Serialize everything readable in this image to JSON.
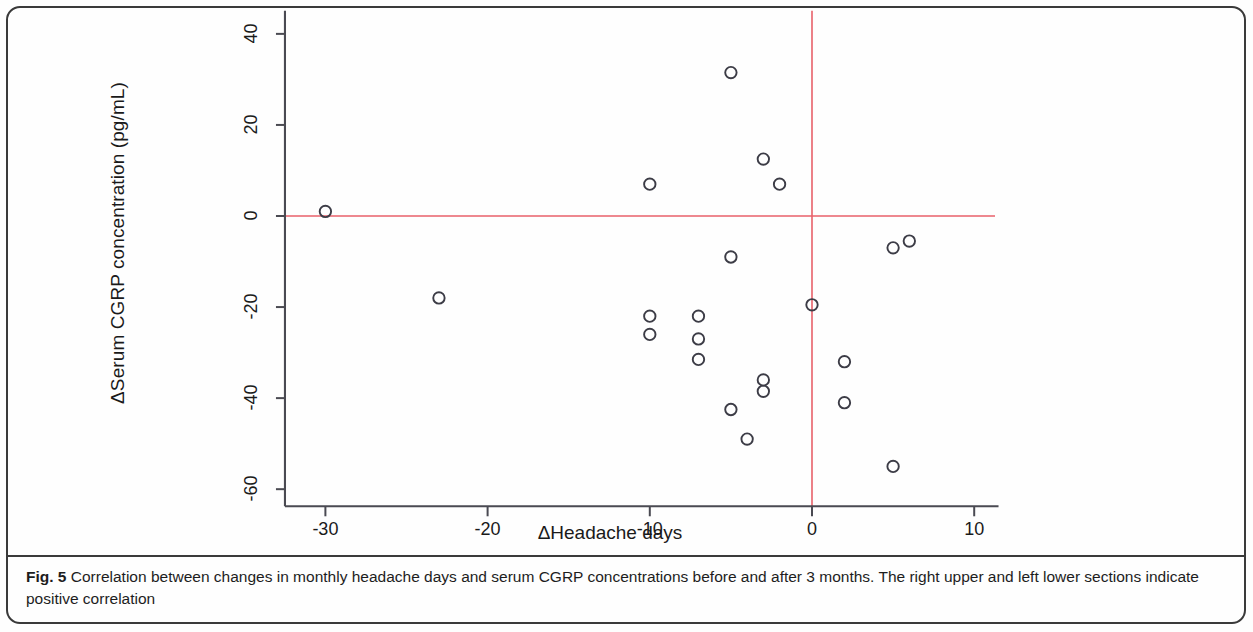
{
  "figure": {
    "label": "Fig. 5",
    "caption": "Correlation between changes in monthly headache days and serum CGRP concentrations before and after 3 months. The right upper and left lower sections indicate positive correlation"
  },
  "colors": {
    "reference_line": "#e8616a",
    "axis": "#4a4a52",
    "marker_stroke": "#3c3c46",
    "text": "#1a1a1a",
    "frame": "#3a3a3a"
  },
  "chart_data": {
    "type": "scatter",
    "title": "",
    "xlabel": "ΔHeadache days",
    "ylabel": "ΔSerum CGRP concentration (pg/mL)",
    "xlim": [
      -32,
      11.5
    ],
    "ylim": [
      -62,
      42
    ],
    "xticks": [
      -30,
      -20,
      -10,
      0,
      10
    ],
    "xtick_labels": [
      "-30",
      "-20",
      "-10",
      "0",
      "10"
    ],
    "yticks": [
      40,
      20,
      0,
      -20,
      -40,
      -60
    ],
    "ytick_labels": [
      "40",
      "20",
      "0",
      "-20",
      "-40",
      "-60"
    ],
    "grid": false,
    "legend": null,
    "reference_lines": [
      {
        "orientation": "horizontal",
        "value": 0,
        "color": "#e8616a"
      },
      {
        "orientation": "vertical",
        "value": 0,
        "color": "#e8616a"
      }
    ],
    "marker": {
      "shape": "open-circle",
      "size": 7,
      "stroke": "#3c3c46",
      "fill": "none"
    },
    "n_points": 22,
    "points": [
      {
        "x": -30,
        "y": 1
      },
      {
        "x": -23,
        "y": -18
      },
      {
        "x": -10,
        "y": 7
      },
      {
        "x": -10,
        "y": -22
      },
      {
        "x": -10,
        "y": -26
      },
      {
        "x": -7,
        "y": -22
      },
      {
        "x": -7,
        "y": -27
      },
      {
        "x": -7,
        "y": -31.5
      },
      {
        "x": -5,
        "y": 31.5
      },
      {
        "x": -5,
        "y": -9
      },
      {
        "x": -5,
        "y": -42.5
      },
      {
        "x": -4,
        "y": -49
      },
      {
        "x": -3,
        "y": 12.5
      },
      {
        "x": -3,
        "y": -36
      },
      {
        "x": -3,
        "y": -38.5
      },
      {
        "x": -2,
        "y": 7
      },
      {
        "x": 0,
        "y": -19.5
      },
      {
        "x": 2,
        "y": -32
      },
      {
        "x": 2,
        "y": -41
      },
      {
        "x": 5,
        "y": -7
      },
      {
        "x": 5,
        "y": -55
      },
      {
        "x": 6,
        "y": -5.5
      }
    ]
  }
}
